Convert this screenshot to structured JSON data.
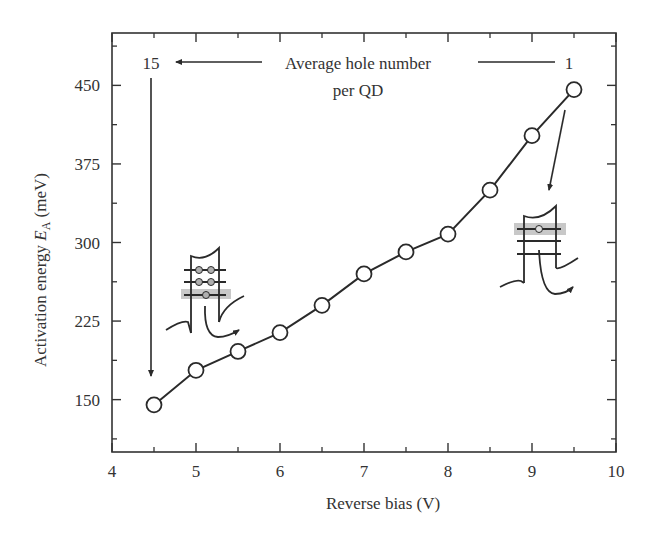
{
  "chart_data": {
    "type": "line",
    "title": "",
    "xlabel": "Reverse bias (V)",
    "ylabel": "Activation energy E_A (meV)",
    "ylabel_parts": {
      "main": "Activation energy ",
      "symbol": "E",
      "subscript": "A",
      "unit": " (meV)"
    },
    "xlim": [
      4,
      10
    ],
    "ylim": [
      100,
      500
    ],
    "x_ticks": [
      4,
      5,
      6,
      7,
      8,
      9,
      10
    ],
    "x_tick_labels": [
      "4",
      "5",
      "6",
      "7",
      "8",
      "9",
      "10"
    ],
    "x_minor_ticks": [
      4.5,
      5.5,
      6.5,
      7.5,
      8.5,
      9.5
    ],
    "y_ticks": [
      150,
      225,
      300,
      375,
      450
    ],
    "y_tick_labels": [
      "150",
      "225",
      "300",
      "375",
      "450"
    ],
    "y_minor_ticks": [
      112.5,
      187.5,
      262.5,
      337.5,
      412.5,
      487.5
    ],
    "grid": false,
    "marker": "open-circle",
    "series": [
      {
        "name": "Activation energy",
        "x": [
          4.5,
          5.0,
          5.5,
          6.0,
          6.5,
          7.0,
          7.5,
          8.0,
          8.5,
          9.0,
          9.5
        ],
        "values": [
          145,
          178,
          196,
          214,
          240,
          270,
          291,
          308,
          350,
          402,
          446
        ]
      }
    ],
    "annotations": [
      {
        "text": "Average hole number",
        "line2": "per QD"
      },
      {
        "text": "15",
        "position": "top-left",
        "arrow": "points down to first data point (4.5 V)"
      },
      {
        "text": "1",
        "position": "top-right",
        "arrow": "from last data point (9.5 V) down to inset"
      },
      {
        "text": "inset-left",
        "description": "QD band diagram with 5 holes, lowest level highlighted, emission arrow"
      },
      {
        "text": "inset-right",
        "description": "QD band diagram with 1 hole in highlighted level, emission arrow"
      }
    ]
  },
  "labels": {
    "annotation_line1": "Average hole number",
    "annotation_line2": "per QD",
    "left_number": "15",
    "right_number": "1"
  },
  "colors": {
    "axis": "#333333",
    "line": "#2a2a2a",
    "marker_fill": "#ffffff",
    "highlight": "#c8c8c8",
    "hole_fill": "#b0b0b0"
  }
}
